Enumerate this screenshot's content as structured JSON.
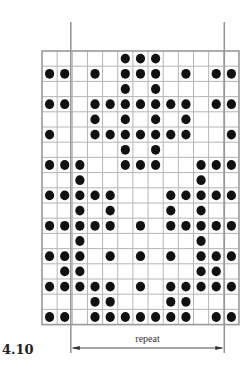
{
  "figure": {
    "label": "4.10",
    "repeat_label": "repeat",
    "colors": {
      "grid_line": "#b5b5b5",
      "border": "#9a9a9a",
      "dot": "#111111",
      "repeat_line": "#999999",
      "arrow": "#333333"
    },
    "grid": {
      "rows": 18,
      "cols": 13,
      "repeat_start_col": 2,
      "repeat_end_col": 12,
      "filled": [
        [
          5,
          6,
          7
        ],
        [
          0,
          1,
          3,
          5,
          6,
          7,
          9,
          11,
          12
        ],
        [
          5,
          7
        ],
        [
          0,
          1,
          3,
          4,
          5,
          6,
          7,
          8,
          9,
          11,
          12
        ],
        [
          3,
          5,
          7,
          9
        ],
        [
          0,
          3,
          4,
          5,
          6,
          7,
          8,
          9,
          12
        ],
        [
          5,
          7
        ],
        [
          0,
          1,
          2,
          5,
          6,
          7,
          10,
          11,
          12
        ],
        [
          2,
          10
        ],
        [
          0,
          1,
          2,
          3,
          4,
          8,
          9,
          10,
          11,
          12
        ],
        [
          2,
          4,
          8,
          10
        ],
        [
          0,
          1,
          2,
          3,
          4,
          6,
          8,
          9,
          10,
          11,
          12
        ],
        [
          2,
          10
        ],
        [
          0,
          1,
          2,
          4,
          6,
          8,
          10,
          11,
          12
        ],
        [
          1,
          2,
          10,
          11
        ],
        [
          0,
          1,
          2,
          3,
          4,
          6,
          8,
          9,
          10,
          11,
          12
        ],
        [
          3,
          4,
          8,
          9
        ],
        [
          0,
          1,
          3,
          4,
          5,
          6,
          7,
          8,
          9,
          11,
          12
        ]
      ]
    }
  }
}
